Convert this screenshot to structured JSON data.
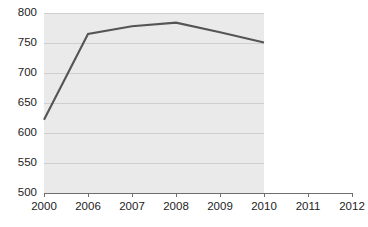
{
  "chart_data": {
    "type": "line",
    "title": "",
    "subtitle": "",
    "xlabel": "",
    "ylabel": "",
    "categories": [
      "2000",
      "2006",
      "2007",
      "2008",
      "2009",
      "2010",
      "2011",
      "2012"
    ],
    "series": [
      {
        "name": "",
        "values": [
          622,
          765,
          778,
          784,
          768,
          751,
          null,
          null
        ]
      }
    ],
    "ylim": [
      500,
      800
    ],
    "yticks": [
      500,
      550,
      600,
      650,
      700,
      750,
      800
    ],
    "ytick_labels": [
      "500",
      "550",
      "600",
      "650",
      "700",
      "750",
      "800"
    ],
    "xtick_labels": [
      "2000",
      "2006",
      "2007",
      "2008",
      "2009",
      "2010",
      "2011",
      "2012"
    ],
    "grid": true,
    "grid_axis": "y",
    "legend": false,
    "legend_position": "none",
    "annotations": [],
    "plot_area_last_category": "2010",
    "colors": {
      "line": "#555555",
      "plot_background": "#eaeaea",
      "gridline": "#cfcfcf",
      "axis": "#6e6e6e",
      "figure_background": "#ffffff",
      "text": "#1d1d1d"
    }
  }
}
